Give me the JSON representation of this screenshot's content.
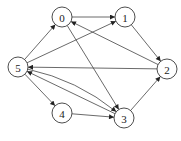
{
  "diagram": {
    "type": "directed-graph",
    "node_radius": 10,
    "colors": {
      "stroke": "#3a3a3a",
      "edge": "#444444",
      "label": "#222222",
      "background": "#ffffff"
    },
    "nodes": [
      {
        "id": "0",
        "label": "0",
        "x": 62,
        "y": 17
      },
      {
        "id": "1",
        "label": "1",
        "x": 125,
        "y": 17
      },
      {
        "id": "2",
        "label": "2",
        "x": 167,
        "y": 69
      },
      {
        "id": "3",
        "label": "3",
        "x": 124,
        "y": 118
      },
      {
        "id": "4",
        "label": "4",
        "x": 62,
        "y": 113
      },
      {
        "id": "5",
        "label": "5",
        "x": 18,
        "y": 67
      }
    ],
    "edges": [
      {
        "from": "0",
        "to": "1",
        "curve": 0
      },
      {
        "from": "0",
        "to": "3",
        "curve": 0
      },
      {
        "from": "1",
        "to": "2",
        "curve": 0
      },
      {
        "from": "2",
        "to": "0",
        "curve": 0
      },
      {
        "from": "2",
        "to": "5",
        "curve": 0
      },
      {
        "from": "3",
        "to": "2",
        "curve": 0
      },
      {
        "from": "3",
        "to": "5",
        "curve": 0
      },
      {
        "from": "4",
        "to": "3",
        "curve": 0
      },
      {
        "from": "5",
        "to": "0",
        "curve": 0
      },
      {
        "from": "5",
        "to": "1",
        "curve": 0
      },
      {
        "from": "5",
        "to": "3",
        "curve": -14
      },
      {
        "from": "5",
        "to": "4",
        "curve": 0
      }
    ]
  }
}
